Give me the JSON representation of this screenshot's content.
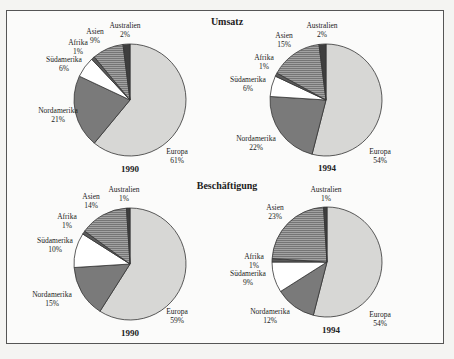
{
  "colors": {
    "Europa": "#d7d7d5",
    "Nordamerika": "#7a7a7a",
    "Südamerika": "#ffffff",
    "Afrika": "#5a5a5a",
    "Asien": "#9a9a9a",
    "Australien": "#3e3e3e",
    "outline": "#333333"
  },
  "chart_data": [
    {
      "type": "pie",
      "section": "Umsatz",
      "title": "1990",
      "categories": [
        "Europa",
        "Nordamerika",
        "Südamerika",
        "Afrika",
        "Asien",
        "Australien"
      ],
      "values": [
        61,
        21,
        6,
        1,
        9,
        2
      ],
      "unit": "%",
      "center": [
        130,
        100
      ],
      "radius": 56,
      "labels": [
        {
          "name": "Europa",
          "value": "61%",
          "x": 177,
          "y": 154
        },
        {
          "name": "Nordamerika",
          "value": "21%",
          "x": 58,
          "y": 113
        },
        {
          "name": "Südamerika",
          "value": "6%",
          "x": 64,
          "y": 62
        },
        {
          "name": "Afrika",
          "value": "1%",
          "x": 78,
          "y": 45
        },
        {
          "name": "Asien",
          "value": "9%",
          "x": 95,
          "y": 34
        },
        {
          "name": "Australien",
          "value": "2%",
          "x": 125,
          "y": 28
        }
      ],
      "year_pos": [
        130,
        172
      ]
    },
    {
      "type": "pie",
      "section": "Umsatz",
      "title": "1994",
      "categories": [
        "Europa",
        "Nordamerika",
        "Südamerika",
        "Afrika",
        "Asien",
        "Australien"
      ],
      "values": [
        54,
        22,
        6,
        1,
        15,
        2
      ],
      "unit": "%",
      "center": [
        326,
        100
      ],
      "radius": 56,
      "labels": [
        {
          "name": "Europa",
          "value": "54%",
          "x": 380,
          "y": 154
        },
        {
          "name": "Nordamerika",
          "value": "22%",
          "x": 256,
          "y": 141
        },
        {
          "name": "Südamerika",
          "value": "6%",
          "x": 248,
          "y": 82
        },
        {
          "name": "Afrika",
          "value": "1%",
          "x": 264,
          "y": 60
        },
        {
          "name": "Asien",
          "value": "15%",
          "x": 284,
          "y": 38
        },
        {
          "name": "Australien",
          "value": "2%",
          "x": 322,
          "y": 28
        }
      ],
      "year_pos": [
        327,
        171
      ]
    },
    {
      "type": "pie",
      "section": "Beschäftigung",
      "title": "1990",
      "categories": [
        "Europa",
        "Nordamerika",
        "Südamerika",
        "Afrika",
        "Asien",
        "Australien"
      ],
      "values": [
        59,
        15,
        10,
        1,
        14,
        1
      ],
      "unit": "%",
      "center": [
        130,
        264
      ],
      "radius": 56,
      "labels": [
        {
          "name": "Europa",
          "value": "59%",
          "x": 177,
          "y": 314
        },
        {
          "name": "Nordamerika",
          "value": "15%",
          "x": 52,
          "y": 297
        },
        {
          "name": "Südamerika",
          "value": "10%",
          "x": 55,
          "y": 243
        },
        {
          "name": "Afrika",
          "value": "1%",
          "x": 67,
          "y": 219
        },
        {
          "name": "Asien",
          "value": "14%",
          "x": 91,
          "y": 199
        },
        {
          "name": "Australien",
          "value": "1%",
          "x": 124,
          "y": 192
        }
      ],
      "year_pos": [
        130,
        336
      ]
    },
    {
      "type": "pie",
      "section": "Beschäftigung",
      "title": "1994",
      "categories": [
        "Europa",
        "Nordamerika",
        "Südamerika",
        "Afrika",
        "Asien",
        "Australien"
      ],
      "values": [
        54,
        12,
        9,
        1,
        23,
        1
      ],
      "unit": "%",
      "center": [
        327,
        262
      ],
      "radius": 55,
      "labels": [
        {
          "name": "Europa",
          "value": "54%",
          "x": 380,
          "y": 317
        },
        {
          "name": "Nordamerika",
          "value": "12%",
          "x": 270,
          "y": 314
        },
        {
          "name": "Südamerika",
          "value": "9%",
          "x": 248,
          "y": 276
        },
        {
          "name": "Afrika",
          "value": "1%",
          "x": 254,
          "y": 259
        },
        {
          "name": "Asien",
          "value": "23%",
          "x": 275,
          "y": 210
        },
        {
          "name": "Australien",
          "value": "1%",
          "x": 326,
          "y": 192
        }
      ],
      "year_pos": [
        331,
        333
      ]
    }
  ],
  "sections": {
    "top_title": "Umsatz",
    "bottom_title": "Beschäftigung"
  }
}
